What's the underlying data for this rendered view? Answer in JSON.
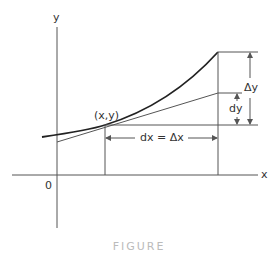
{
  "diagram": {
    "axis_labels": {
      "y": "y",
      "x": "x",
      "origin": "0"
    },
    "point_label": "(x,y)",
    "dx_label": "dx = Δx",
    "delta_y_label": "Δy",
    "dy_label": "dy",
    "caption": "FIGURE",
    "colors": {
      "line": "#555555",
      "curve": "#222222",
      "background": "#ffffff"
    }
  }
}
